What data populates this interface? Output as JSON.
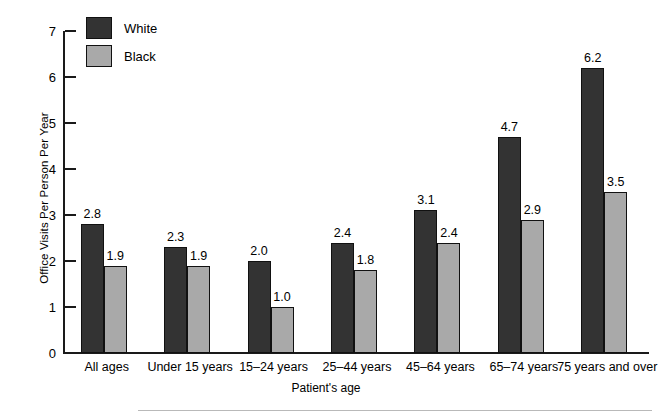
{
  "chart_data": {
    "type": "bar",
    "title": "",
    "xlabel": "Patient's age",
    "ylabel": "Office Visits Per Person Per Year",
    "ylim": [
      0,
      7
    ],
    "yticks": [
      0,
      1,
      2,
      3,
      4,
      5,
      6,
      7
    ],
    "grid": false,
    "legend_position": "top-left",
    "categories": [
      "All ages",
      "Under 15 years",
      "15–24 years",
      "25–44 years",
      "45–64 years",
      "65–74 years",
      "75 years and over"
    ],
    "series": [
      {
        "name": "White",
        "color": "#333333",
        "values": [
          2.8,
          2.3,
          2.0,
          2.4,
          3.1,
          4.7,
          6.2
        ],
        "labels": [
          "2.8",
          "2.3",
          "2.0",
          "2.4",
          "3.1",
          "4.7",
          "6.2"
        ]
      },
      {
        "name": "Black",
        "color": "#a9a9a9",
        "values": [
          1.9,
          1.9,
          1.0,
          1.8,
          2.4,
          2.9,
          3.5
        ],
        "labels": [
          "1.9",
          "1.9",
          "1.0",
          "1.8",
          "2.4",
          "2.9",
          "3.5"
        ]
      }
    ]
  },
  "axis": {
    "tick_labels": [
      "0",
      "1",
      "2",
      "3",
      "4",
      "5",
      "6",
      "7"
    ]
  },
  "legend": {
    "items": [
      {
        "label": "White"
      },
      {
        "label": "Black"
      }
    ]
  }
}
